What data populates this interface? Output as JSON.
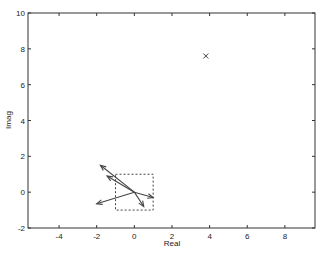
{
  "chart_data": {
    "type": "scatter",
    "title": "",
    "xlabel": "Real",
    "ylabel": "Imag",
    "xlim": [
      -5.65,
      9.6
    ],
    "ylim": [
      -2,
      10
    ],
    "xticks": [
      -4,
      -2,
      0,
      2,
      4,
      6,
      8
    ],
    "yticks": [
      -2,
      0,
      2,
      4,
      6,
      8,
      10
    ],
    "grid": false,
    "legend": null,
    "markers": [
      {
        "x": 3.8,
        "y": 7.6,
        "symbol": "x"
      }
    ],
    "vectors": [
      {
        "from": [
          0,
          0
        ],
        "to": [
          -1.8,
          1.5
        ]
      },
      {
        "from": [
          0,
          0
        ],
        "to": [
          -1.45,
          0.9
        ]
      },
      {
        "from": [
          0,
          0
        ],
        "to": [
          -2.0,
          -0.65
        ]
      },
      {
        "from": [
          0,
          0
        ],
        "to": [
          1.0,
          -0.3
        ]
      },
      {
        "from": [
          0,
          0
        ],
        "to": [
          0.5,
          -0.8
        ]
      }
    ],
    "dashed_box": {
      "x0": -1,
      "x1": 1,
      "y0": -1,
      "y1": 1
    }
  },
  "colors": {
    "axis": "#333333",
    "data": "#444444"
  }
}
